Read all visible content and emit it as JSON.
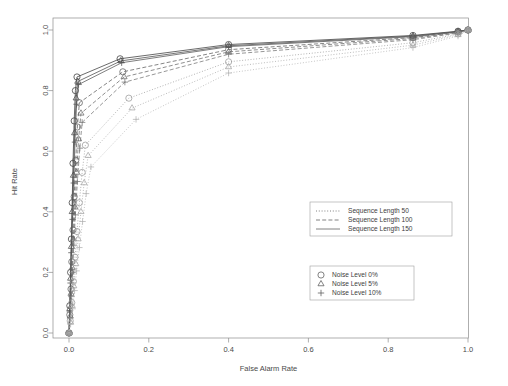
{
  "chart_data": {
    "type": "line",
    "title": "",
    "xlabel": "False Alarm Rate",
    "ylabel": "Hit Rate",
    "xlim": [
      0.0,
      1.0
    ],
    "ylim": [
      0.0,
      1.0
    ],
    "xticks": [
      "0.0",
      "0.2",
      "0.4",
      "0.6",
      "0.8",
      "1.0"
    ],
    "xtickvals": [
      0.0,
      0.2,
      0.4,
      0.6,
      0.8,
      1.0
    ],
    "yticks": [
      "0.0",
      "0.2",
      "0.4",
      "0.6",
      "0.8",
      "1.0"
    ],
    "ytickvals": [
      0.0,
      0.2,
      0.4,
      0.6,
      0.8,
      1.0
    ],
    "grid": false,
    "legend_position": "center-right",
    "series": [
      {
        "name": "Sequence Length 150 / Noise Level 0%",
        "linestyle": "solid",
        "marker": "circle",
        "color": "#3a3a3a",
        "x": [
          0.0,
          0.002,
          0.004,
          0.006,
          0.008,
          0.01,
          0.013,
          0.016,
          0.02,
          0.128,
          0.4,
          0.862,
          0.975,
          1.0
        ],
        "y": [
          0.0,
          0.09,
          0.2,
          0.31,
          0.43,
          0.56,
          0.7,
          0.8,
          0.845,
          0.905,
          0.952,
          0.982,
          0.996,
          1.0
        ]
      },
      {
        "name": "Sequence Length 150 / Noise Level 5%",
        "linestyle": "solid",
        "marker": "triangle",
        "color": "#4a4a4a",
        "x": [
          0.0,
          0.002,
          0.004,
          0.006,
          0.008,
          0.011,
          0.014,
          0.018,
          0.022,
          0.13,
          0.4,
          0.862,
          0.975,
          1.0
        ],
        "y": [
          0.0,
          0.08,
          0.18,
          0.285,
          0.4,
          0.52,
          0.66,
          0.775,
          0.83,
          0.898,
          0.948,
          0.98,
          0.995,
          1.0
        ]
      },
      {
        "name": "Sequence Length 150 / Noise Level 10%",
        "linestyle": "solid",
        "marker": "plus",
        "color": "#545454",
        "x": [
          0.0,
          0.002,
          0.004,
          0.006,
          0.009,
          0.012,
          0.015,
          0.019,
          0.024,
          0.132,
          0.4,
          0.862,
          0.975,
          1.0
        ],
        "y": [
          0.0,
          0.07,
          0.165,
          0.265,
          0.375,
          0.495,
          0.63,
          0.755,
          0.82,
          0.892,
          0.945,
          0.978,
          0.994,
          1.0
        ]
      },
      {
        "name": "Sequence Length 100 / Noise Level 0%",
        "linestyle": "dashed",
        "marker": "circle",
        "color": "#5e5e5e",
        "x": [
          0.0,
          0.002,
          0.005,
          0.007,
          0.01,
          0.013,
          0.017,
          0.021,
          0.026,
          0.135,
          0.4,
          0.862,
          0.975,
          1.0
        ],
        "y": [
          0.0,
          0.06,
          0.145,
          0.235,
          0.34,
          0.45,
          0.57,
          0.68,
          0.76,
          0.862,
          0.935,
          0.975,
          0.993,
          1.0
        ]
      },
      {
        "name": "Sequence Length 100 / Noise Level 5%",
        "linestyle": "dashed",
        "marker": "triangle",
        "color": "#6a6a6a",
        "x": [
          0.0,
          0.003,
          0.005,
          0.008,
          0.011,
          0.015,
          0.019,
          0.024,
          0.03,
          0.138,
          0.4,
          0.862,
          0.975,
          1.0
        ],
        "y": [
          0.0,
          0.055,
          0.13,
          0.215,
          0.31,
          0.415,
          0.53,
          0.64,
          0.725,
          0.845,
          0.928,
          0.972,
          0.992,
          1.0
        ]
      },
      {
        "name": "Sequence Length 100 / Noise Level 10%",
        "linestyle": "dashed",
        "marker": "plus",
        "color": "#747474",
        "x": [
          0.0,
          0.003,
          0.006,
          0.009,
          0.012,
          0.016,
          0.021,
          0.027,
          0.033,
          0.14,
          0.4,
          0.862,
          0.975,
          1.0
        ],
        "y": [
          0.0,
          0.05,
          0.12,
          0.2,
          0.29,
          0.39,
          0.5,
          0.61,
          0.695,
          0.828,
          0.92,
          0.968,
          0.99,
          1.0
        ]
      },
      {
        "name": "Sequence Length 50 / Noise Level 0%",
        "linestyle": "dotted",
        "marker": "circle",
        "color": "#9a9a9a",
        "x": [
          0.0,
          0.003,
          0.007,
          0.011,
          0.015,
          0.02,
          0.026,
          0.033,
          0.041,
          0.15,
          0.4,
          0.862,
          0.975,
          1.0
        ],
        "y": [
          0.0,
          0.04,
          0.1,
          0.17,
          0.25,
          0.335,
          0.43,
          0.53,
          0.62,
          0.775,
          0.895,
          0.958,
          0.987,
          1.0
        ]
      },
      {
        "name": "Sequence Length 50 / Noise Level 5%",
        "linestyle": "dotted",
        "marker": "triangle",
        "color": "#a6a6a6",
        "x": [
          0.0,
          0.004,
          0.008,
          0.012,
          0.017,
          0.023,
          0.03,
          0.038,
          0.048,
          0.158,
          0.4,
          0.862,
          0.975,
          1.0
        ],
        "y": [
          0.0,
          0.035,
          0.09,
          0.155,
          0.228,
          0.31,
          0.4,
          0.495,
          0.585,
          0.742,
          0.878,
          0.95,
          0.984,
          1.0
        ]
      },
      {
        "name": "Sequence Length 50 / Noise Level 10%",
        "linestyle": "dotted",
        "marker": "plus",
        "color": "#b2b2b2",
        "x": [
          0.0,
          0.004,
          0.009,
          0.014,
          0.019,
          0.026,
          0.034,
          0.043,
          0.055,
          0.168,
          0.4,
          0.862,
          0.975,
          1.0
        ],
        "y": [
          0.0,
          0.03,
          0.08,
          0.14,
          0.205,
          0.282,
          0.368,
          0.46,
          0.548,
          0.705,
          0.858,
          0.942,
          0.98,
          1.0
        ]
      }
    ]
  },
  "legend_lines": {
    "items": [
      {
        "label": "Sequence Length 50",
        "style": "dotted"
      },
      {
        "label": "Sequence Length 100",
        "style": "dashed"
      },
      {
        "label": "Sequence Length 150",
        "style": "solid"
      }
    ]
  },
  "legend_markers": {
    "items": [
      {
        "label": "Noise Level 0%",
        "marker": "circle"
      },
      {
        "label": "Noise Level 5%",
        "marker": "triangle"
      },
      {
        "label": "Noise Level 10%",
        "marker": "plus"
      }
    ]
  }
}
